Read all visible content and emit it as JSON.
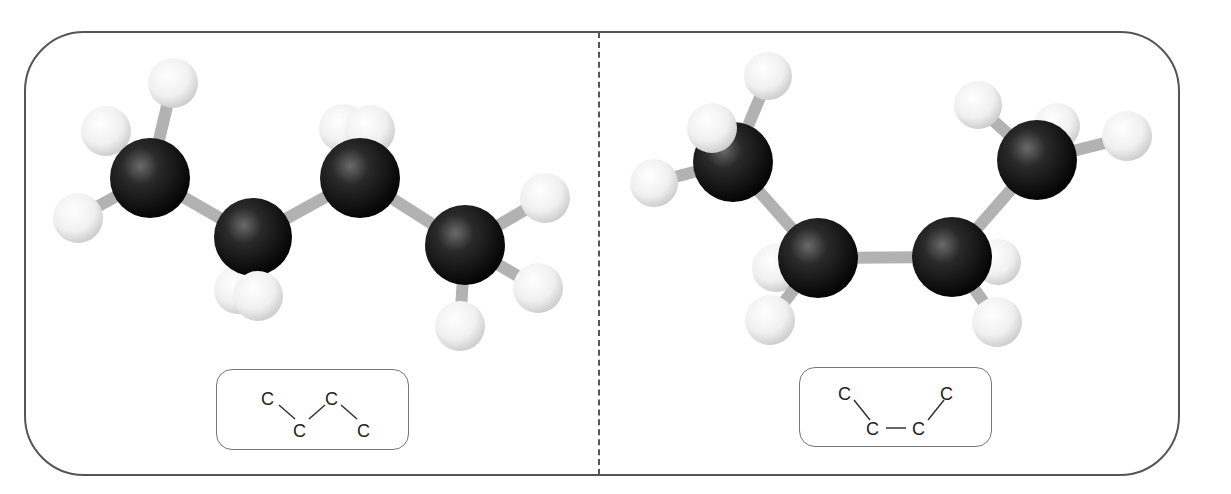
{
  "panels": [
    {
      "id": "left",
      "conformation": "anti",
      "skeletal_formula": {
        "atoms": [
          {
            "label": "C",
            "x": 52,
            "y": 28
          },
          {
            "label": "C",
            "x": 84,
            "y": 60
          },
          {
            "label": "C",
            "x": 116,
            "y": 28
          },
          {
            "label": "C",
            "x": 148,
            "y": 60
          }
        ]
      }
    },
    {
      "id": "right",
      "conformation": "gauche",
      "skeletal_formula": {
        "atoms": [
          {
            "label": "C",
            "x": 48,
            "y": 24
          },
          {
            "label": "C",
            "x": 76,
            "y": 60
          },
          {
            "label": "C",
            "x": 122,
            "y": 60
          },
          {
            "label": "C",
            "x": 150,
            "y": 24
          }
        ]
      }
    }
  ],
  "colors": {
    "frame": "#555555",
    "carbon": "#1a1a1a",
    "hydrogen": "#f2f2f2",
    "bond": "#b0b0b0"
  }
}
